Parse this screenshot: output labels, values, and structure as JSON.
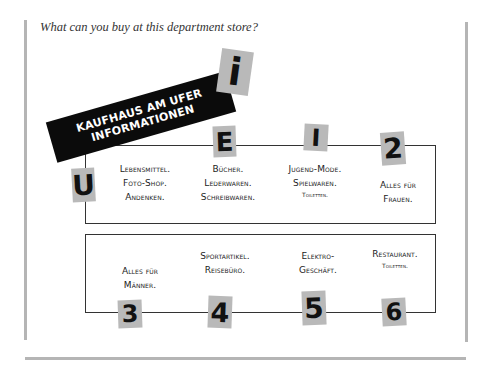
{
  "question": "What can you buy at this department store?",
  "banner": {
    "line1": "KAUFHAUS AM UFER",
    "line2": "INFORMATIONEN"
  },
  "signs": {
    "info": "i",
    "U": "U",
    "E": "E",
    "I": "I",
    "2": "2",
    "3": "3",
    "4": "4",
    "5": "5",
    "6": "6"
  },
  "floors": {
    "U": {
      "lines": [
        "Lebensmittel.",
        "Foto-Shop.",
        "Andenken."
      ]
    },
    "E": {
      "lines": [
        "Bücher.",
        "Lederwaren.",
        "Schreibwaren."
      ]
    },
    "I": {
      "lines": [
        "Jugend-Mode.",
        "Spielwaren."
      ],
      "small": "Toiletten."
    },
    "2": {
      "lines": [
        "Alles für",
        "Frauen."
      ]
    },
    "3": {
      "lines": [
        "Alles für",
        "Männer."
      ]
    },
    "4": {
      "lines": [
        "Sportartikel.",
        "Reisebüro."
      ]
    },
    "5": {
      "lines": [
        "Elektro-",
        "Geschäft."
      ]
    },
    "6": {
      "lines": [
        "Restaurant."
      ],
      "small": "Toiletten."
    }
  },
  "colors": {
    "sign_bg": "#b9b9b9",
    "banner_bg": "#0b0b0b",
    "rule": "#b5b5b5"
  }
}
